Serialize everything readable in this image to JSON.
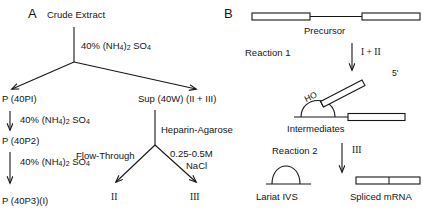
{
  "figure": {
    "panel_a": {
      "label": "A",
      "nodes": {
        "crude_extract": "Crude Extract",
        "p40p1": "P (40PI)",
        "p40p2": "P (40P2)",
        "p40p3": "P (40P3)(I)",
        "sup40w": "Sup (40W) (II + III)",
        "flow_through_product": "II",
        "nacl_product": "III"
      },
      "edge_labels": {
        "as_1": "40% (NH4)2 SO4",
        "as_2": "40% (NH4)2 SO4",
        "as_3": "40% (NH4)2 SO4",
        "heparin": "Heparin-Agarose",
        "flow_through": "Flow-Through",
        "nacl": "0.25-0.5M NaCl",
        "nacl_line1": "0.25-0.5M",
        "nacl_line2": "NaCl"
      },
      "ammonium_sulfate": {
        "percent": "40%",
        "formula_pre": "(NH",
        "formula_sub1": "4",
        "formula_mid": ")",
        "formula_sub2": "2",
        "formula_post": "SO",
        "formula_sub3": "4"
      }
    },
    "panel_b": {
      "label": "B",
      "nodes": {
        "precursor": "Precursor",
        "intermediates": "Intermediates",
        "lariat_ivs": "Lariat IVS",
        "spliced_mrna": "Spliced mRNA"
      },
      "edge_labels": {
        "reaction_1": "Reaction 1",
        "reaction_1_products": "I + II",
        "reaction_2": "Reaction 2",
        "reaction_2_products": "III"
      },
      "annotations": {
        "hydroxyl": "HO",
        "five_prime": "5'"
      }
    }
  },
  "colors": {
    "ink": "#161616",
    "background": "#ffffff"
  }
}
